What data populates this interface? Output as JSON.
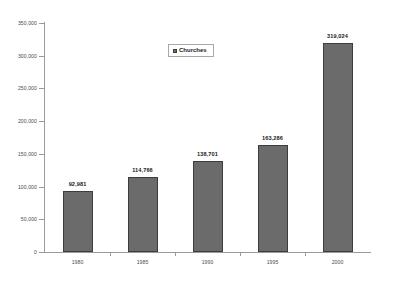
{
  "chart_data": {
    "type": "bar",
    "title": "",
    "xlabel": "",
    "ylabel": "",
    "categories": [
      "1980",
      "1985",
      "1990",
      "1995",
      "2000"
    ],
    "values": [
      92981,
      114766,
      138701,
      163286,
      319024
    ],
    "value_labels": [
      "92,981",
      "114,766",
      "138,701",
      "163,286",
      "319,024"
    ],
    "series": [
      {
        "name": "Churches",
        "values": [
          92981,
          114766,
          138701,
          163286,
          319024
        ],
        "color": "#6b6b6b"
      }
    ],
    "ylim": [
      0,
      350000
    ],
    "ytick_step": 50000,
    "ytick_labels": [
      "350,000",
      "300,000",
      "250,000",
      "200,000",
      "150,000",
      "100,000",
      "50,000",
      "0"
    ],
    "ytick_values": [
      350000,
      300000,
      250000,
      200000,
      150000,
      100000,
      50000,
      0
    ],
    "grid": false,
    "legend": {
      "position": "top-center",
      "boxed": true,
      "entries": [
        {
          "label": "Churches",
          "marker": "square-marker",
          "color": "#6b6b6b"
        }
      ]
    },
    "colors": {
      "bar_fill": "#6b6b6b",
      "bar_outline": "#3d3d3d",
      "axis": "#9a9a9a",
      "tick_text": "#4a4a4a",
      "label_text": "#1a1a1a",
      "background": "#ffffff"
    }
  }
}
